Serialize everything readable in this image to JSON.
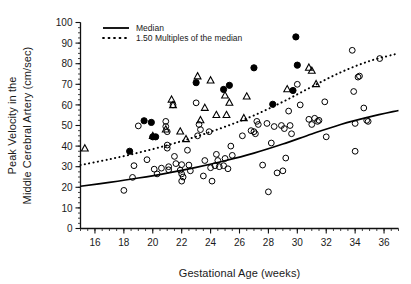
{
  "chart_data": {
    "type": "scatter",
    "title": "",
    "xlabel": "Gestational Age (weeks)",
    "ylabel": "Peak Velocity in the Middle Cerebral Artery (cm/sec)",
    "ylabel_line1": "Peak Velocity in the",
    "ylabel_line2": "Middle Cerebral Artery (cm/sec)",
    "xlim": [
      15,
      37
    ],
    "ylim": [
      0,
      100
    ],
    "xticks": [
      16,
      18,
      20,
      22,
      24,
      26,
      28,
      30,
      32,
      34,
      36
    ],
    "yticks": [
      0,
      10,
      20,
      30,
      40,
      50,
      60,
      70,
      80,
      90,
      100
    ],
    "x_minor_tick_step": 0.5,
    "y_minor_tick_step": 2.5,
    "grid": false,
    "legend_position": "top-left",
    "legend": [
      {
        "label": "Median",
        "style": "solid-line",
        "color": "#000000"
      },
      {
        "label": "1.50 Multiples of the median",
        "style": "dotted-line",
        "color": "#000000"
      }
    ],
    "series": [
      {
        "name": "open-circle",
        "marker": "open circle",
        "color": "#000000",
        "points": [
          [
            18.0,
            18.5
          ],
          [
            18.6,
            24.8
          ],
          [
            18.7,
            30.5
          ],
          [
            19.0,
            49.8
          ],
          [
            19.6,
            33.4
          ],
          [
            20.1,
            28.8
          ],
          [
            20.3,
            26.5
          ],
          [
            20.6,
            29.3
          ],
          [
            20.9,
            52.0
          ],
          [
            20.9,
            49.5
          ],
          [
            21.0,
            47.0
          ],
          [
            21.0,
            40.5
          ],
          [
            21.0,
            39.0
          ],
          [
            21.1,
            30.0
          ],
          [
            21.1,
            28.5
          ],
          [
            21.4,
            60.0
          ],
          [
            21.5,
            35.0
          ],
          [
            21.6,
            31.5
          ],
          [
            21.9,
            28.3
          ],
          [
            22.0,
            31.0
          ],
          [
            22.0,
            26.5
          ],
          [
            22.0,
            23.0
          ],
          [
            22.1,
            25.0
          ],
          [
            22.4,
            38.0
          ],
          [
            22.5,
            30.8
          ],
          [
            22.6,
            28.0
          ],
          [
            23.0,
            61.0
          ],
          [
            23.1,
            45.0
          ],
          [
            23.2,
            50.5
          ],
          [
            23.3,
            48.0
          ],
          [
            23.5,
            25.5
          ],
          [
            23.6,
            33.0
          ],
          [
            23.9,
            47.0
          ],
          [
            24.0,
            29.5
          ],
          [
            24.1,
            23.0
          ],
          [
            24.3,
            30.5
          ],
          [
            24.4,
            36.0
          ],
          [
            24.5,
            33.0
          ],
          [
            24.6,
            30.0
          ],
          [
            24.9,
            30.5
          ],
          [
            25.0,
            34.0
          ],
          [
            25.2,
            29.0
          ],
          [
            25.4,
            40.0
          ],
          [
            25.5,
            35.5
          ],
          [
            26.2,
            45.0
          ],
          [
            26.8,
            47.5
          ],
          [
            27.0,
            47.0
          ],
          [
            27.1,
            46.0
          ],
          [
            27.2,
            52.0
          ],
          [
            27.3,
            50.5
          ],
          [
            27.6,
            30.8
          ],
          [
            27.9,
            51.0
          ],
          [
            28.0,
            17.8
          ],
          [
            28.2,
            41.5
          ],
          [
            28.4,
            49.5
          ],
          [
            28.6,
            27.0
          ],
          [
            28.9,
            50.0
          ],
          [
            29.0,
            28.0
          ],
          [
            29.1,
            48.5
          ],
          [
            29.2,
            34.2
          ],
          [
            29.4,
            57.0
          ],
          [
            29.5,
            50.0
          ],
          [
            29.6,
            46.0
          ],
          [
            30.0,
            70.0
          ],
          [
            30.2,
            60.0
          ],
          [
            30.8,
            53.0
          ],
          [
            31.0,
            50.5
          ],
          [
            31.2,
            53.5
          ],
          [
            31.4,
            52.0
          ],
          [
            31.5,
            52.5
          ],
          [
            31.9,
            61.5
          ],
          [
            32.0,
            44.5
          ],
          [
            33.8,
            86.5
          ],
          [
            33.9,
            66.5
          ],
          [
            34.0,
            51.0
          ],
          [
            34.0,
            37.5
          ],
          [
            34.2,
            73.5
          ],
          [
            34.3,
            74.0
          ],
          [
            34.6,
            58.5
          ],
          [
            34.8,
            52.5
          ],
          [
            34.9,
            52.0
          ],
          [
            35.7,
            82.5
          ]
        ]
      },
      {
        "name": "filled-circle",
        "marker": "filled circle",
        "color": "#000000",
        "points": [
          [
            18.4,
            37.5
          ],
          [
            19.4,
            52.3
          ],
          [
            19.9,
            51.5
          ],
          [
            20.0,
            44.5
          ],
          [
            20.2,
            44.5
          ],
          [
            23.0,
            70.8
          ],
          [
            24.9,
            67.5
          ],
          [
            25.3,
            69.5
          ],
          [
            27.0,
            78.0
          ],
          [
            28.3,
            60.3
          ],
          [
            29.7,
            67.0
          ],
          [
            29.9,
            93.0
          ],
          [
            30.0,
            79.3
          ]
        ]
      },
      {
        "name": "open-triangle",
        "marker": "open triangle",
        "color": "#000000",
        "points": [
          [
            15.3,
            38.8
          ],
          [
            20.0,
            44.8
          ],
          [
            20.9,
            48.0
          ],
          [
            21.3,
            62.5
          ],
          [
            21.4,
            59.8
          ],
          [
            21.9,
            47.0
          ],
          [
            22.3,
            43.3
          ],
          [
            23.1,
            73.8
          ],
          [
            23.3,
            52.5
          ],
          [
            23.6,
            58.5
          ],
          [
            24.0,
            71.8
          ],
          [
            24.4,
            55.0
          ],
          [
            25.0,
            64.5
          ],
          [
            25.1,
            55.0
          ],
          [
            25.3,
            61.0
          ],
          [
            26.3,
            53.5
          ],
          [
            26.5,
            64.0
          ],
          [
            29.3,
            67.5
          ],
          [
            30.8,
            78.0
          ],
          [
            31.0,
            76.5
          ],
          [
            31.3,
            70.0
          ]
        ]
      }
    ],
    "curves": [
      {
        "name": "median",
        "style": "solid",
        "color": "#000000",
        "points": [
          [
            15.0,
            20.5
          ],
          [
            17.0,
            22.4
          ],
          [
            19.0,
            24.5
          ],
          [
            21.0,
            26.9
          ],
          [
            23.0,
            29.7
          ],
          [
            25.0,
            32.9
          ],
          [
            27.0,
            36.6
          ],
          [
            29.0,
            41.0
          ],
          [
            31.0,
            45.9
          ],
          [
            33.0,
            50.5
          ],
          [
            35.0,
            54.2
          ],
          [
            37.0,
            57.3
          ]
        ]
      },
      {
        "name": "1.50-multiples-of-median",
        "style": "dotted",
        "color": "#000000",
        "points": [
          [
            15.0,
            30.8
          ],
          [
            17.0,
            33.6
          ],
          [
            19.0,
            36.8
          ],
          [
            21.0,
            40.4
          ],
          [
            23.0,
            44.6
          ],
          [
            25.0,
            49.4
          ],
          [
            27.0,
            54.9
          ],
          [
            29.0,
            61.5
          ],
          [
            31.0,
            68.8
          ],
          [
            33.0,
            75.8
          ],
          [
            35.0,
            81.3
          ],
          [
            37.0,
            85.0
          ]
        ]
      }
    ]
  }
}
